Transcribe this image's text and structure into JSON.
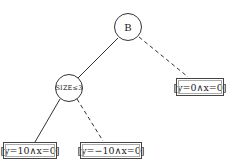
{
  "diagram": {
    "type": "decision-tree",
    "nodes": [
      {
        "id": "root",
        "shape": "circle",
        "label": "B"
      },
      {
        "id": "size",
        "shape": "circle",
        "label": "SIZE≤3"
      },
      {
        "id": "leaf_right",
        "shape": "box",
        "label": "[y=0∧x=0]"
      },
      {
        "id": "leaf_left",
        "shape": "box",
        "label": "[y=10∧x=0]"
      },
      {
        "id": "leaf_mid",
        "shape": "box",
        "label": "[y=−10∧x=0]"
      }
    ],
    "edges": [
      {
        "from": "root",
        "to": "size",
        "style": "solid"
      },
      {
        "from": "root",
        "to": "leaf_right",
        "style": "dashed"
      },
      {
        "from": "size",
        "to": "leaf_left",
        "style": "solid"
      },
      {
        "from": "size",
        "to": "leaf_mid",
        "style": "dashed"
      }
    ],
    "colors": {
      "line": "#333333",
      "background": "#ffffff"
    }
  }
}
